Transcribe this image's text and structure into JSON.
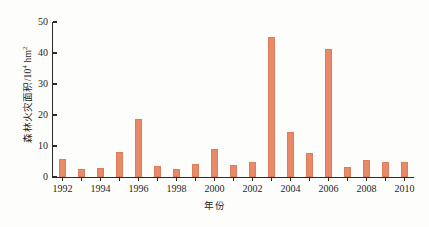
{
  "figure": {
    "background_color": "#fdfdfc",
    "axis_color": "#2b2b2b",
    "bar_color": "#e88a68"
  },
  "axes": {
    "y_title_main": "森林火灾面积/10",
    "y_title_sup": "4",
    "y_title_unit": " hm",
    "y_title_unit_sup": "2",
    "x_title": "年份"
  },
  "chart_data": {
    "type": "bar",
    "title": "",
    "xlabel": "年份",
    "ylabel": "森林火灾面积/10⁴ hm²",
    "categories": [
      "1992",
      "1993",
      "1994",
      "1995",
      "1996",
      "1997",
      "1998",
      "1999",
      "2000",
      "2001",
      "2002",
      "2003",
      "2004",
      "2005",
      "2006",
      "2007",
      "2008",
      "2009",
      "2010"
    ],
    "values": [
      5.8,
      2.7,
      3.0,
      8.0,
      18.6,
      3.5,
      2.6,
      4.2,
      9.0,
      3.9,
      4.8,
      45.2,
      14.6,
      7.8,
      41.2,
      3.1,
      5.4,
      4.9,
      4.8
    ],
    "ylim": [
      0,
      50
    ],
    "xlim": [
      "1991.3",
      "2010.7"
    ],
    "y_ticks": [
      0,
      10,
      20,
      30,
      40,
      50
    ],
    "y_tick_labels": [
      "0",
      "10",
      "20",
      "30",
      "40",
      "50"
    ],
    "x_tick_labels": [
      "1992",
      "1994",
      "1996",
      "1998",
      "2000",
      "2002",
      "2004",
      "2006",
      "2008",
      "2010"
    ],
    "grid": false,
    "legend": null,
    "legend_position": "none",
    "series": [
      {
        "name": "森林火灾面积",
        "values": [
          5.8,
          2.7,
          3.0,
          8.0,
          18.6,
          3.5,
          2.6,
          4.2,
          9.0,
          3.9,
          4.8,
          45.2,
          14.6,
          7.8,
          41.2,
          3.1,
          5.4,
          4.9,
          4.8
        ]
      }
    ]
  }
}
